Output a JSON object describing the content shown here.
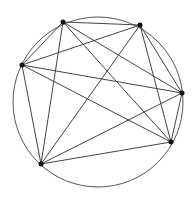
{
  "diagram": {
    "type": "complete-graph-inscribed-in-circle",
    "circle": {
      "cx": 98,
      "cy": 102,
      "r": 85,
      "stroke": "#555555"
    },
    "points": [
      {
        "id": "P1",
        "x": 63,
        "y": 22
      },
      {
        "id": "P2",
        "x": 140,
        "y": 25
      },
      {
        "id": "P3",
        "x": 22,
        "y": 65
      },
      {
        "id": "P4",
        "x": 182,
        "y": 93
      },
      {
        "id": "P5",
        "x": 171,
        "y": 142
      },
      {
        "id": "P6",
        "x": 41,
        "y": 164
      }
    ],
    "edges": [
      [
        "P1",
        "P2"
      ],
      [
        "P1",
        "P3"
      ],
      [
        "P1",
        "P4"
      ],
      [
        "P1",
        "P5"
      ],
      [
        "P1",
        "P6"
      ],
      [
        "P2",
        "P3"
      ],
      [
        "P2",
        "P4"
      ],
      [
        "P2",
        "P5"
      ],
      [
        "P2",
        "P6"
      ],
      [
        "P3",
        "P4"
      ],
      [
        "P3",
        "P5"
      ],
      [
        "P3",
        "P6"
      ],
      [
        "P4",
        "P5"
      ],
      [
        "P4",
        "P6"
      ],
      [
        "P5",
        "P6"
      ]
    ],
    "line_color": "#444444",
    "point_color": "#111111"
  }
}
